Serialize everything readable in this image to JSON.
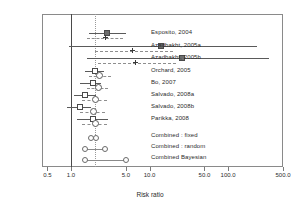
{
  "chart_data": {
    "type": "forest",
    "title": "",
    "xlabel": "Risk ratio",
    "ylabel": "Citation",
    "xscale": "log",
    "xlim": [
      0.4,
      600
    ],
    "xticks": [
      0.5,
      1.0,
      5.0,
      10.0,
      50.0,
      100.0,
      500.0
    ],
    "xticklabels": [
      "0.5",
      "1.0",
      "5.0",
      "10.0",
      "50.0",
      "100.0",
      "500.0"
    ],
    "grid": false,
    "legend": "none",
    "reference_lines": [
      {
        "name": "null-effect",
        "value": 1.0,
        "style": "solid"
      },
      {
        "name": "pooled-estimate",
        "value": 2.0,
        "style": "dotted"
      }
    ],
    "studies": [
      {
        "label": "Esposito, 2004",
        "estimate": 2.9,
        "ci_low": 1.7,
        "ci_high": 5.0,
        "marker": "square-filled",
        "bayes_estimate": 2.7,
        "bayes_ci_low": 1.6,
        "bayes_ci_high": 4.6,
        "bayes_marker": "cross"
      },
      {
        "label": "Azadbakht, 2005a",
        "estimate": 14.0,
        "ci_low": 0.95,
        "ci_high": 230.0,
        "marker": "square-filled",
        "bayes_estimate": 6.0,
        "bayes_ci_low": 2.0,
        "bayes_ci_high": 20.0,
        "bayes_marker": "cross"
      },
      {
        "label": "Azadbakht, 2005b",
        "estimate": 26.0,
        "ci_low": 1.6,
        "ci_high": 330.0,
        "marker": "square-filled",
        "bayes_estimate": 6.5,
        "bayes_ci_low": 2.2,
        "bayes_ci_high": 22.0,
        "bayes_marker": "cross"
      },
      {
        "label": "Orchard, 2005",
        "estimate": 2.0,
        "ci_low": 1.5,
        "ci_high": 2.6,
        "marker": "square",
        "bayes_estimate": 2.3,
        "bayes_ci_low": 1.7,
        "bayes_ci_high": 3.2,
        "bayes_marker": "circle"
      },
      {
        "label": "Bo, 2007",
        "estimate": 1.9,
        "ci_low": 1.3,
        "ci_high": 2.4,
        "marker": "square",
        "bayes_estimate": 2.2,
        "bayes_ci_low": 1.6,
        "bayes_ci_high": 3.0,
        "bayes_marker": "circle"
      },
      {
        "label": "Salvado, 2008a",
        "estimate": 1.5,
        "ci_low": 1.1,
        "ci_high": 2.1,
        "marker": "square",
        "bayes_estimate": 2.0,
        "bayes_ci_low": 1.4,
        "bayes_ci_high": 2.9,
        "bayes_marker": "circle"
      },
      {
        "label": "Salvado, 2008b",
        "estimate": 1.3,
        "ci_low": 0.9,
        "ci_high": 1.8,
        "marker": "square",
        "bayes_estimate": 1.9,
        "bayes_ci_low": 1.3,
        "bayes_ci_high": 2.7,
        "bayes_marker": "circle"
      },
      {
        "label": "Parikka, 2008",
        "estimate": 1.9,
        "ci_low": 1.2,
        "ci_high": 3.0,
        "marker": "square",
        "bayes_estimate": 2.0,
        "bayes_ci_low": 1.4,
        "bayes_ci_high": 2.9,
        "bayes_marker": "circle"
      }
    ],
    "combined": [
      {
        "label": "Combined : fixed",
        "estimate": 1.95,
        "ci_low": 1.8,
        "ci_high": 2.1
      },
      {
        "label": "Combined : random",
        "estimate": 2.0,
        "ci_low": 1.5,
        "ci_high": 2.7
      },
      {
        "label": "Combined Bayesian",
        "estimate": 2.3,
        "ci_low": 1.5,
        "ci_high": 5.0
      }
    ]
  }
}
